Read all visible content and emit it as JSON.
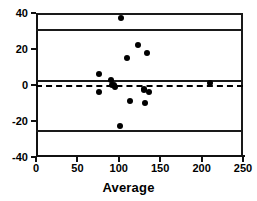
{
  "chart_data": {
    "type": "scatter",
    "title": "",
    "xlabel": "Average",
    "ylabel": "",
    "xlim": [
      0,
      250
    ],
    "ylim": [
      -40,
      40
    ],
    "xticks": [
      0,
      50,
      100,
      150,
      200,
      250
    ],
    "yticks": [
      40,
      20,
      0,
      -20,
      -40
    ],
    "xtick_labels": [
      "0",
      "50",
      "100",
      "150",
      "200",
      "250"
    ],
    "ytick_labels": [
      "40",
      "20",
      "0",
      "-20",
      "-40"
    ],
    "grid": false,
    "legend": null,
    "points": [
      {
        "x": 76,
        "y": 6
      },
      {
        "x": 76,
        "y": -4
      },
      {
        "x": 91,
        "y": 3
      },
      {
        "x": 92,
        "y": 0
      },
      {
        "x": 94,
        "y": 0
      },
      {
        "x": 95,
        "y": -1
      },
      {
        "x": 103,
        "y": 37
      },
      {
        "x": 102,
        "y": -23
      },
      {
        "x": 110,
        "y": 15
      },
      {
        "x": 113,
        "y": -9
      },
      {
        "x": 123,
        "y": 22
      },
      {
        "x": 130,
        "y": -2
      },
      {
        "x": 131,
        "y": -3
      },
      {
        "x": 132,
        "y": -10
      },
      {
        "x": 134,
        "y": 18
      },
      {
        "x": 136,
        "y": -4
      },
      {
        "x": 210,
        "y": 1
      }
    ],
    "reference_lines": [
      {
        "name": "upper-limit-of-agreement",
        "value": 31,
        "style": "solid"
      },
      {
        "name": "bias-line",
        "value": 3,
        "style": "solid"
      },
      {
        "name": "zero-line",
        "value": 0,
        "style": "dashed"
      },
      {
        "name": "lower-limit-of-agreement",
        "value": -25,
        "style": "solid"
      }
    ],
    "colors": {
      "axis": "#111111",
      "marker": "#000000",
      "reference": "#1a1a1a",
      "background": "#ffffff"
    }
  }
}
